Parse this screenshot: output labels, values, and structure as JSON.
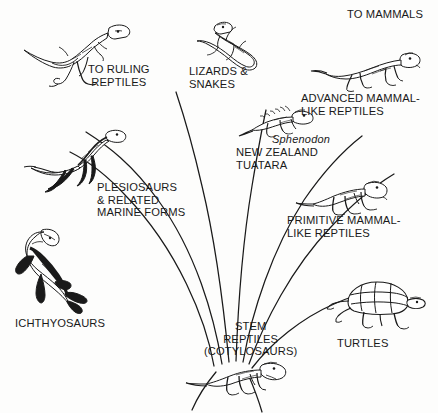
{
  "figure": {
    "background_color": "#fdfdfc",
    "ink_color": "#1a1a1a"
  },
  "labels": [
    {
      "key": "to_ruling_reptiles",
      "text": "TO RULING\nREPTILES",
      "x": 88,
      "y": 63,
      "align": "center",
      "italic": false
    },
    {
      "key": "lizards_and_snakes",
      "text": "LIZARDS &\nSNAKES",
      "x": 189,
      "y": 65,
      "align": "left",
      "italic": false
    },
    {
      "key": "to_mammals",
      "text": "TO MAMMALS",
      "x": 347,
      "y": 8,
      "align": "left",
      "italic": false
    },
    {
      "key": "advanced_mammal_like_reptiles",
      "text": "ADVANCED MAMMAL-\nLIKE REPTILES",
      "x": 301,
      "y": 92,
      "align": "left",
      "italic": false
    },
    {
      "key": "sphenodon",
      "text": "Sphenodon",
      "x": 272,
      "y": 133,
      "align": "left",
      "italic": true
    },
    {
      "key": "new_zealand_tuatara",
      "text": "NEW ZEALAND\nTUATARA",
      "x": 236,
      "y": 146,
      "align": "left",
      "italic": false
    },
    {
      "key": "primitive_mammal_like_reptiles",
      "text": "PRIMITIVE MAMMAL-\nLIKE REPTILES",
      "x": 287,
      "y": 214,
      "align": "left",
      "italic": false
    },
    {
      "key": "plesiosaurs",
      "text": "PLESIOSAURS\n& RELATED\nMARINE FORMS",
      "x": 97,
      "y": 181,
      "align": "left",
      "italic": false
    },
    {
      "key": "ichthyosaurs",
      "text": "ICHTHYOSAURS",
      "x": 15,
      "y": 317,
      "align": "left",
      "italic": false
    },
    {
      "key": "stem_reptiles",
      "text": "STEM\nREPTILES\n(COTYLOSAURS)",
      "x": 204,
      "y": 320,
      "align": "center",
      "italic": false
    },
    {
      "key": "turtles",
      "text": "TURTLES",
      "x": 337,
      "y": 337,
      "align": "left",
      "italic": false
    }
  ],
  "organisms": [
    {
      "key": "ruling-reptile",
      "common_name": "ruling reptile (bipedal archosaur)",
      "label_key": "to_ruling_reptiles"
    },
    {
      "key": "lizard",
      "common_name": "lizard",
      "label_key": "lizards_and_snakes"
    },
    {
      "key": "cynodont",
      "common_name": "advanced mammal-like reptile",
      "label_key": "advanced_mammal_like_reptiles"
    },
    {
      "key": "tuatara",
      "common_name": "Sphenodon, New Zealand tuatara",
      "label_key": "new_zealand_tuatara"
    },
    {
      "key": "pelycosaur",
      "common_name": "primitive mammal-like reptile",
      "label_key": "primitive_mammal_like_reptiles"
    },
    {
      "key": "plesiosaur",
      "common_name": "plesiosaur",
      "label_key": "plesiosaurs"
    },
    {
      "key": "ichthyosaur",
      "common_name": "ichthyosaur",
      "label_key": "ichthyosaurs"
    },
    {
      "key": "turtle",
      "common_name": "turtle",
      "label_key": "turtles"
    },
    {
      "key": "cotylosaur",
      "common_name": "stem reptile (cotylosaur)",
      "label_key": "stem_reptiles"
    }
  ],
  "branches": {
    "origin": {
      "x": 232,
      "y": 368
    },
    "paths": [
      "M 214 366 C 206 320 178 250 126 196 C 104 172 86 160 70 152",
      "M 222 364 C 214 316 196 252 158 200 C 132 164 108 146 86 132",
      "M 229 362 C 224 310 216 244 202 186 C 192 142 184 116 176 92",
      "M 236 361 C 238 306 243 240 252 186 C 258 150 262 128 266 110",
      "M 243 362 C 252 312 272 250 304 200 C 326 168 344 150 362 136",
      "M 249 364 C 264 322 292 268 330 228 C 354 202 374 186 394 174",
      "M 252 368 C 272 342 302 318 334 304 C 352 296 366 292 378 290",
      "M 216 372 C 206 384 198 396 192 410",
      "M 248 374 C 254 388 258 398 262 412"
    ]
  }
}
